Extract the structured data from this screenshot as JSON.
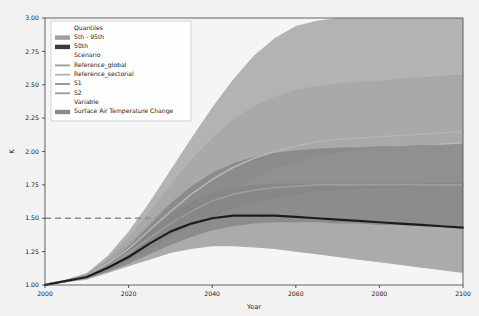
{
  "chart_data": {
    "type": "area",
    "title": "",
    "xlabel": "Year",
    "ylabel": "K",
    "xlim": [
      2000,
      2100
    ],
    "ylim": [
      1.0,
      3.0
    ],
    "xticks": [
      2000,
      2020,
      2040,
      2060,
      2080,
      2100
    ],
    "xticklabels": [
      "2000",
      "2020",
      "2040",
      "2060",
      "2080",
      "2100"
    ],
    "yticks": [
      1.0,
      1.25,
      1.5,
      1.75,
      2.0,
      2.25,
      2.5,
      2.75,
      3.0
    ],
    "yticklabels": [
      "1.00",
      "1.25",
      "1.50",
      "1.75",
      "2.00",
      "2.25",
      "2.50",
      "2.75",
      "3.00"
    ],
    "grid": false,
    "legend_position": "upper-left",
    "variable": "Surface Air Temperature Change",
    "units": "K",
    "reference_line": {
      "label": "1.5 K threshold",
      "value": 1.5,
      "style": "dashed",
      "color": "#8c8c8c"
    },
    "x": [
      2000,
      2005,
      2010,
      2015,
      2020,
      2025,
      2030,
      2035,
      2040,
      2045,
      2050,
      2055,
      2060,
      2065,
      2070,
      2075,
      2080,
      2085,
      2090,
      2095,
      2100
    ],
    "series": [
      {
        "name": "Reference_global",
        "type": "band_and_line",
        "quantile_label": "5th - 95th",
        "color": "#9a9a9a",
        "line_color": "#a8a8a8",
        "p05": [
          1.0,
          1.02,
          1.05,
          1.12,
          1.2,
          1.31,
          1.42,
          1.53,
          1.63,
          1.72,
          1.8,
          1.87,
          1.92,
          1.96,
          1.99,
          2.01,
          2.03,
          2.04,
          2.05,
          2.06,
          2.07
        ],
        "p95": [
          1.01,
          1.04,
          1.09,
          1.22,
          1.4,
          1.62,
          1.86,
          2.1,
          2.33,
          2.54,
          2.72,
          2.85,
          2.94,
          2.98,
          3.0,
          3.0,
          3.0,
          3.0,
          3.0,
          3.0,
          3.0
        ],
        "p50": [
          1.0,
          1.03,
          1.07,
          1.17,
          1.3,
          1.46,
          1.63,
          1.8,
          1.96,
          2.1,
          2.22,
          2.31,
          2.38,
          2.43,
          2.47,
          2.5,
          2.52,
          2.54,
          2.55,
          2.56,
          2.57
        ]
      },
      {
        "name": "Reference_sectorial",
        "type": "band_and_line",
        "quantile_label": "5th - 95th",
        "color": "#a5a5a5",
        "line_color": "#b4b4b4",
        "p05": [
          1.0,
          1.02,
          1.05,
          1.11,
          1.18,
          1.27,
          1.36,
          1.44,
          1.51,
          1.57,
          1.62,
          1.65,
          1.68,
          1.7,
          1.71,
          1.72,
          1.73,
          1.73,
          1.74,
          1.74,
          1.75
        ],
        "p95": [
          1.01,
          1.04,
          1.08,
          1.2,
          1.36,
          1.55,
          1.75,
          1.94,
          2.1,
          2.24,
          2.34,
          2.41,
          2.46,
          2.49,
          2.51,
          2.52,
          2.53,
          2.54,
          2.55,
          2.56,
          2.57
        ],
        "p50": [
          1.0,
          1.03,
          1.07,
          1.16,
          1.27,
          1.41,
          1.55,
          1.68,
          1.79,
          1.88,
          1.95,
          2.0,
          2.04,
          2.07,
          2.09,
          2.1,
          2.11,
          2.12,
          2.13,
          2.14,
          2.15
        ]
      },
      {
        "name": "S1",
        "type": "band_and_line",
        "quantile_label": "5th - 95th",
        "color": "#808080",
        "line_color": "#9d9d9d",
        "p05": [
          1.0,
          1.02,
          1.05,
          1.1,
          1.16,
          1.23,
          1.3,
          1.36,
          1.41,
          1.44,
          1.46,
          1.47,
          1.47,
          1.47,
          1.46,
          1.46,
          1.45,
          1.45,
          1.44,
          1.44,
          1.43
        ],
        "p95": [
          1.01,
          1.04,
          1.08,
          1.18,
          1.31,
          1.46,
          1.61,
          1.74,
          1.84,
          1.91,
          1.96,
          1.99,
          2.01,
          2.02,
          2.03,
          2.03,
          2.04,
          2.04,
          2.05,
          2.05,
          2.06
        ],
        "p50": [
          1.0,
          1.03,
          1.07,
          1.14,
          1.24,
          1.35,
          1.46,
          1.55,
          1.63,
          1.68,
          1.71,
          1.73,
          1.74,
          1.75,
          1.75,
          1.75,
          1.75,
          1.75,
          1.75,
          1.75,
          1.75
        ]
      },
      {
        "name": "S2",
        "type": "band_and_line",
        "quantile_label": "5th - 95th",
        "color": "#8f8f8f",
        "line_color": "#a0a0a0",
        "p05": [
          1.0,
          1.02,
          1.04,
          1.09,
          1.14,
          1.19,
          1.24,
          1.27,
          1.29,
          1.29,
          1.28,
          1.27,
          1.25,
          1.23,
          1.21,
          1.19,
          1.17,
          1.15,
          1.13,
          1.11,
          1.09
        ],
        "p95": [
          1.01,
          1.04,
          1.08,
          1.17,
          1.28,
          1.41,
          1.53,
          1.62,
          1.69,
          1.73,
          1.75,
          1.76,
          1.76,
          1.76,
          1.76,
          1.76,
          1.76,
          1.76,
          1.76,
          1.77,
          1.77
        ],
        "p50": [
          1.0,
          1.03,
          1.06,
          1.13,
          1.21,
          1.31,
          1.4,
          1.46,
          1.5,
          1.52,
          1.52,
          1.52,
          1.51,
          1.5,
          1.49,
          1.48,
          1.47,
          1.46,
          1.45,
          1.44,
          1.43
        ]
      }
    ],
    "median_line": {
      "name": "50th",
      "color": "#1c1c1c",
      "values": [
        1.0,
        1.03,
        1.06,
        1.13,
        1.21,
        1.31,
        1.4,
        1.46,
        1.5,
        1.52,
        1.52,
        1.52,
        1.51,
        1.5,
        1.49,
        1.48,
        1.47,
        1.46,
        1.45,
        1.44,
        1.43
      ]
    }
  },
  "legend": {
    "groups": [
      {
        "title": "Quantiles",
        "entries": [
          {
            "label": "5th - 95th",
            "swatch": "patch",
            "color": "#a0a0a0"
          },
          {
            "label": "50th",
            "swatch": "patch",
            "color": "#3a3a3a"
          }
        ]
      },
      {
        "title": "Scenario",
        "entries": [
          {
            "label": "Reference_global",
            "swatch": "line",
            "color": "#9b9b9b"
          },
          {
            "label": "Reference_sectorial",
            "swatch": "line",
            "color": "#b0b0b0"
          },
          {
            "label": "S1",
            "swatch": "line",
            "color": "#8d8d8d"
          },
          {
            "label": "S2",
            "swatch": "line",
            "color": "#9a9a9a"
          }
        ]
      },
      {
        "title": "Variable",
        "entries": [
          {
            "label": "Surface Air Temperature Change",
            "swatch": "patch",
            "color": "#8a8a8a"
          }
        ]
      }
    ]
  }
}
